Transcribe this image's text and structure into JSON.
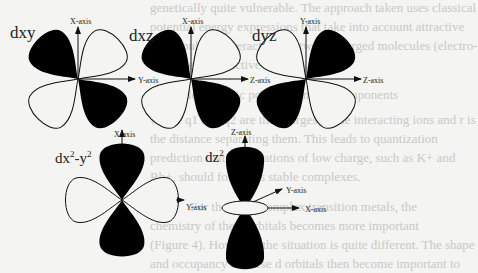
{
  "figure": {
    "orbitals": [
      {
        "id": "dxy",
        "label": "dxy",
        "vertical_axis": "X-axis",
        "horizontal_axis": "Y-axis"
      },
      {
        "id": "dxz",
        "label": "dxz",
        "vertical_axis": "X-axis",
        "horizontal_axis": "Z-axis"
      },
      {
        "id": "dyz",
        "label": "dyz",
        "vertical_axis": "Y-axis",
        "horizontal_axis": "Z-axis"
      },
      {
        "id": "dx2y2",
        "label_main": "dx",
        "label_sup1": "2",
        "label_mid": "-y",
        "label_sup2": "2",
        "vertical_axis": "X-axis",
        "horizontal_axis": "Y-axis"
      },
      {
        "id": "dz2",
        "label_main": "dz",
        "label_sup": "2",
        "vertical_axis": "Z-axis",
        "diagonal_axis": "Y-axis",
        "horizontal_axis": "X-axis"
      }
    ]
  },
  "bleed_through_text": [
    "genetically quite vulnerable. The approach taken uses classical",
    "potential energy expressions that take into account attractive",
    "and repulsive interactions between charged molecules (electro-",
    "negative and reactive centers).",
    "Electrostatic potential energy components",
    "where q1 and q2 are the charges of the interacting ions and r is",
    "the distance separating them. This leads to quantization",
    "prediction that large cations of low charge, such as K+ and",
    "Rb+, should form less stable complexes.",
    "For the more complex transition metals, the",
    "chemistry of the d orbitals becomes more important",
    "(Figure 4). However, the situation is quite different. The shape",
    "and occupancy of these d orbitals then become important to"
  ],
  "colors": {
    "lobe_fill": "#000000",
    "stroke": "#111111",
    "background": "#f4f4f2"
  }
}
